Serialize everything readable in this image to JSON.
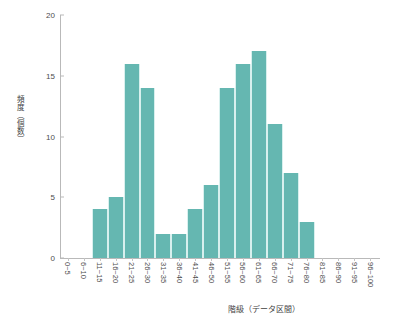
{
  "chart_data": {
    "type": "bar",
    "title": "",
    "xlabel": "階級（データ区間）",
    "ylabel": "頻度（個数）",
    "categories": [
      "0~5",
      "6~10",
      "11~15",
      "16~20",
      "21~25",
      "26~30",
      "31~35",
      "36~40",
      "41~45",
      "46~50",
      "51~55",
      "56~60",
      "61~65",
      "66~70",
      "71~75",
      "76~80",
      "81~85",
      "86~90",
      "91~95",
      "96~100"
    ],
    "values": [
      0,
      0,
      4,
      5,
      16,
      14,
      2,
      2,
      4,
      6,
      14,
      16,
      17,
      11,
      7,
      3,
      0,
      0,
      0,
      0
    ],
    "ylim": [
      0,
      20
    ],
    "yticks": [
      "0",
      "5",
      "10",
      "15",
      "20"
    ],
    "ytick_values": [
      0,
      5,
      10,
      15,
      20
    ],
    "grid": false,
    "legend": "none",
    "bar_color": "#65b7b1",
    "axis_color": "#b9b9b9"
  }
}
